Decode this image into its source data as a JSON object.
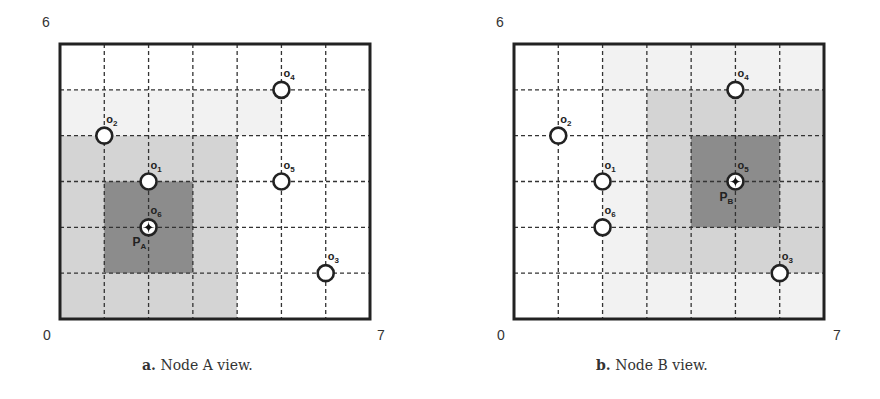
{
  "figure": {
    "grid": {
      "cols": 7,
      "rows": 6,
      "x_min_label": "0",
      "x_max_label": "7",
      "y_max_label": "6"
    },
    "colors": {
      "frame": "#222222",
      "gridline": "#333333",
      "light_region": "#d4d4d4",
      "dark_region": "#8c8c8c",
      "faint_region": "#f2f2f2",
      "node_fill": "#ffffff",
      "node_stroke": "#222222"
    },
    "panels": [
      {
        "id": "a",
        "caption_letter": "a.",
        "caption_text": "Node A view.",
        "observer_label": "P",
        "observer_sub": "A",
        "observer_object": "o6",
        "observer_pos": [
          2,
          2
        ],
        "dark_region": {
          "x0": 1,
          "y0": 1,
          "x1": 3,
          "y1": 3
        },
        "light_region": {
          "x0": 0,
          "y0": 0,
          "x1": 4,
          "y1": 4
        },
        "faint_region": {
          "x0": 0,
          "y0": 4,
          "x1": 5,
          "y1": 5
        },
        "objects": [
          {
            "name": "o1",
            "sub": "1",
            "pos": [
              2,
              3
            ]
          },
          {
            "name": "o2",
            "sub": "2",
            "pos": [
              1,
              4
            ]
          },
          {
            "name": "o3",
            "sub": "3",
            "pos": [
              6,
              1
            ]
          },
          {
            "name": "o4",
            "sub": "4",
            "pos": [
              5,
              5
            ]
          },
          {
            "name": "o5",
            "sub": "5",
            "pos": [
              5,
              3
            ]
          },
          {
            "name": "o6",
            "sub": "6",
            "pos": [
              2,
              2
            ],
            "is_observer": true
          }
        ]
      },
      {
        "id": "b",
        "caption_letter": "b.",
        "caption_text": "Node B view.",
        "observer_label": "P",
        "observer_sub": "B",
        "observer_object": "o5",
        "observer_pos": [
          5,
          3
        ],
        "dark_region": {
          "x0": 4,
          "y0": 2,
          "x1": 6,
          "y1": 4
        },
        "light_region": {
          "x0": 3,
          "y0": 1,
          "x1": 7,
          "y1": 5
        },
        "faint_region": {
          "x0": 2,
          "y0": 0,
          "x1": 7,
          "y1": 6
        },
        "objects": [
          {
            "name": "o1",
            "sub": "1",
            "pos": [
              2,
              3
            ]
          },
          {
            "name": "o2",
            "sub": "2",
            "pos": [
              1,
              4
            ]
          },
          {
            "name": "o3",
            "sub": "3",
            "pos": [
              6,
              1
            ]
          },
          {
            "name": "o4",
            "sub": "4",
            "pos": [
              5,
              5
            ]
          },
          {
            "name": "o5",
            "sub": "5",
            "pos": [
              5,
              3
            ],
            "is_observer": true
          },
          {
            "name": "o6",
            "sub": "6",
            "pos": [
              2,
              2
            ]
          }
        ]
      }
    ]
  }
}
